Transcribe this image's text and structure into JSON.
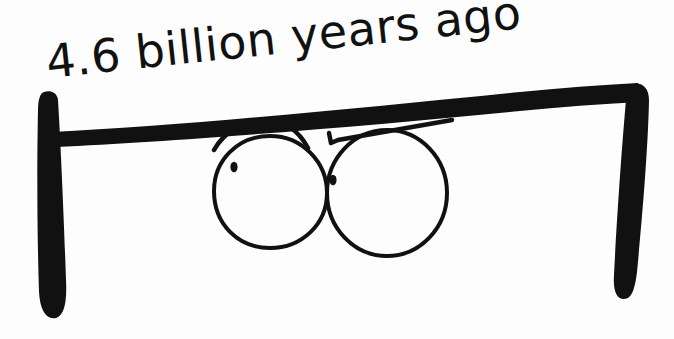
{
  "scene": {
    "title": "4.6 billion years ago",
    "medium": "hand-drawn ink sketch on white paper",
    "background_color": "#fdfdfd",
    "ink_color": "#111111",
    "width": 674,
    "height": 339
  },
  "caption": {
    "text": "4.6 billion years ago",
    "position": "above-left",
    "rotation_degrees": -6,
    "style": "handwritten marker"
  },
  "drawing": {
    "bracket": {
      "name": "timeline-bracket",
      "description": "thick ink bracket spanning the width, open at bottom",
      "left_post_label": "left-bracket-post",
      "right_post_label": "right-bracket-post",
      "crossbar_label": "bracket-crossbar"
    },
    "character": {
      "name": "peeking-eyes",
      "description": "two large cartoon eyes peeking over the bracket bar",
      "left_eye": {
        "label": "left-eye",
        "pupil": "left-pupil"
      },
      "right_eye": {
        "label": "right-eye",
        "pupil": "right-pupil"
      },
      "left_brow": "left-eyebrow",
      "right_brow": "right-eyebrow"
    }
  }
}
